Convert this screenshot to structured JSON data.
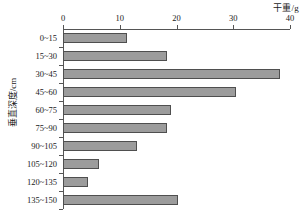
{
  "chart_data": {
    "type": "bar",
    "orientation": "horizontal",
    "title": "",
    "xlabel": "干重/g",
    "ylabel": "垂直深度/cm",
    "categories": [
      "0~15",
      "15~30",
      "30~45",
      "45~60",
      "60~75",
      "75~90",
      "90~105",
      "105~120",
      "120~135",
      "135~150"
    ],
    "values": [
      11.3,
      18.3,
      38.2,
      30.4,
      19.0,
      18.3,
      13.0,
      6.3,
      4.4,
      20.2
    ],
    "xlim": [
      0,
      40
    ],
    "xticks": [
      0,
      10,
      20,
      30,
      40
    ],
    "xtick_labels": [
      "0",
      "10",
      "20",
      "30",
      "40"
    ],
    "grid": false,
    "legend": "none",
    "series_name": "干重",
    "bar_color": "#9c9c9c",
    "bar_border_color": "#4f4f4f",
    "axis_color": "#555555",
    "x_axis_position": "top"
  }
}
